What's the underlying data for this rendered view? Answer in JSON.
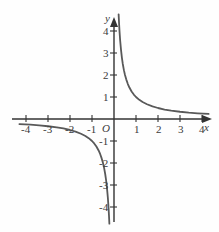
{
  "chart_data": {
    "type": "line",
    "title": "",
    "subtitle": "",
    "xlabel": "x",
    "ylabel": "y",
    "origin_label": "O",
    "xlim": [
      -4.6,
      4.6
    ],
    "ylim": [
      -4.6,
      4.6
    ],
    "grid": false,
    "legend": null,
    "axis_style": "arrows-both-ends-positive",
    "curve_color": "#595959",
    "axis_color": "#333333",
    "background_color": "#fefefe",
    "function": "y = 1/x",
    "xticks": [
      -4,
      -3,
      -2,
      -1,
      1,
      2,
      3,
      4
    ],
    "xtick_labels": [
      "-4",
      "-3",
      "-2",
      "-1",
      "1",
      "2",
      "3",
      "4"
    ],
    "yticks": [
      -4,
      -3,
      -2,
      -1,
      1,
      2,
      3,
      4
    ],
    "ytick_labels": [
      "-4",
      "-3",
      "-2",
      "-1",
      "1",
      "2",
      "3",
      "4"
    ],
    "series": [
      {
        "name": "branch-positive",
        "comment": "right branch, x > 0",
        "x": [
          0.21,
          0.23,
          0.25,
          0.28,
          0.32,
          0.36,
          0.4,
          0.45,
          0.5,
          0.56,
          0.63,
          0.7,
          0.8,
          0.9,
          1.0,
          1.15,
          1.3,
          1.5,
          1.75,
          2.0,
          2.3,
          2.6,
          3.0,
          3.4,
          3.8,
          4.3
        ],
        "y": [
          4.76,
          4.35,
          4.0,
          3.57,
          3.13,
          2.78,
          2.5,
          2.22,
          2.0,
          1.79,
          1.59,
          1.43,
          1.25,
          1.11,
          1.0,
          0.87,
          0.77,
          0.67,
          0.57,
          0.5,
          0.43,
          0.38,
          0.33,
          0.29,
          0.26,
          0.23
        ]
      },
      {
        "name": "branch-negative",
        "comment": "left branch, x < 0",
        "x": [
          -4.3,
          -3.8,
          -3.4,
          -3.0,
          -2.6,
          -2.3,
          -2.0,
          -1.75,
          -1.5,
          -1.3,
          -1.15,
          -1.0,
          -0.9,
          -0.8,
          -0.7,
          -0.63,
          -0.56,
          -0.5,
          -0.45,
          -0.4,
          -0.36,
          -0.32,
          -0.28,
          -0.25,
          -0.23,
          -0.21
        ],
        "y": [
          -0.23,
          -0.26,
          -0.29,
          -0.33,
          -0.38,
          -0.43,
          -0.5,
          -0.57,
          -0.67,
          -0.77,
          -0.87,
          -1.0,
          -1.11,
          -1.25,
          -1.43,
          -1.59,
          -1.79,
          -2.0,
          -2.22,
          -2.5,
          -2.78,
          -3.13,
          -3.57,
          -4.0,
          -4.35,
          -4.76
        ]
      }
    ]
  }
}
